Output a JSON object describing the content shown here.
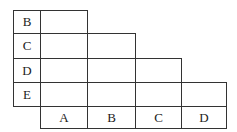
{
  "diagram": {
    "type": "lower-triangular comparison grid",
    "row_labels": [
      "B",
      "C",
      "D",
      "E"
    ],
    "column_labels": [
      "A",
      "B",
      "C",
      "D"
    ],
    "cells_per_row": [
      1,
      2,
      3,
      4
    ],
    "cell_values": "empty"
  }
}
